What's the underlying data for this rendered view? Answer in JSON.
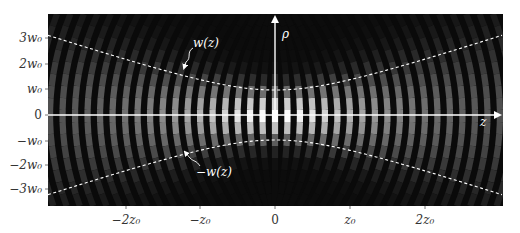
{
  "figure": {
    "plot_area": {
      "x0": 48,
      "y0": 14,
      "x1": 503,
      "y1": 206
    },
    "background_color": "#0a0a0a",
    "axis_color": "#ffffff",
    "envelope_color": "#ffffff"
  },
  "axes": {
    "horizontal_label": "z",
    "vertical_label": "ρ",
    "x_ticks": [
      {
        "label": "−2z₀",
        "value": -2,
        "px": 126
      },
      {
        "label": "−z₀",
        "value": -1,
        "px": 200
      },
      {
        "label": "0",
        "value": 0,
        "px": 275
      },
      {
        "label": "z₀",
        "value": 1,
        "px": 350
      },
      {
        "label": "2z₀",
        "value": 2,
        "px": 425
      }
    ],
    "y_ticks": [
      {
        "label": "3w₀",
        "value": 3,
        "px": 38
      },
      {
        "label": "2w₀",
        "value": 2,
        "px": 64
      },
      {
        "label": "w₀",
        "value": 1,
        "px": 89
      },
      {
        "label": "0",
        "value": 0,
        "px": 115
      },
      {
        "label": "−w₀",
        "value": -1,
        "px": 141
      },
      {
        "label": "−2w₀",
        "value": -2,
        "px": 165
      },
      {
        "label": "−3w₀",
        "value": -3,
        "px": 189
      }
    ]
  },
  "annotations": {
    "upper_envelope": "w(z)",
    "lower_envelope": "−w(z)"
  },
  "beam": {
    "waist_px": 25,
    "rayleigh_px": 75,
    "center_x_px": 275,
    "center_y_px": 115,
    "fringe_spacing_px": 12.5
  }
}
